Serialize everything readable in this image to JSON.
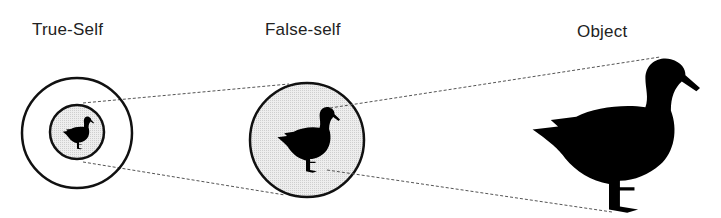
{
  "labels": {
    "true_self": "True-Self",
    "false_self": "False-self",
    "object": "Object"
  },
  "colors": {
    "stroke": "#111111",
    "fill_gray": "#e4e4e4",
    "dash": "#555555",
    "silhouette": "#000000"
  }
}
